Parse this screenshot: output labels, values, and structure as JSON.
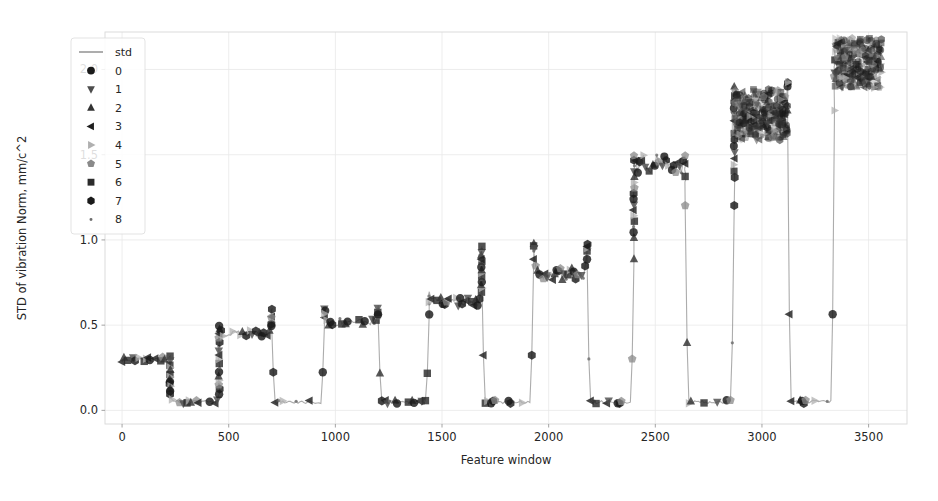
{
  "chart_data": {
    "type": "line",
    "title": "",
    "xlabel": "Feature window",
    "ylabel": "STD of vibration Norm, mm/c^2",
    "xlim": [
      -80,
      3680
    ],
    "ylim": [
      -0.08,
      2.22
    ],
    "xticks": [
      0,
      500,
      1000,
      1500,
      2000,
      2500,
      3000,
      3500
    ],
    "xticklabels": [
      "0",
      "500",
      "1000",
      "1500",
      "2000",
      "2500",
      "3000",
      "3500"
    ],
    "yticks": [
      0.0,
      0.5,
      1.0,
      1.5,
      2.0
    ],
    "yticklabels": [
      "0.0",
      "0.5",
      "1.0",
      "1.5",
      "2.0"
    ],
    "grid": true,
    "legend_position": "upper left",
    "legend_entries": [
      {
        "label": "std",
        "marker": "line",
        "color": "#808080"
      },
      {
        "label": "0",
        "marker": "circle",
        "color": "#1a1a1a"
      },
      {
        "label": "1",
        "marker": "triangle-down",
        "color": "#4d4d4d"
      },
      {
        "label": "2",
        "marker": "triangle-up",
        "color": "#333333"
      },
      {
        "label": "3",
        "marker": "triangle-left",
        "color": "#1f1f1f"
      },
      {
        "label": "4",
        "marker": "triangle-right",
        "color": "#b0b0b0"
      },
      {
        "label": "5",
        "marker": "pentagon",
        "color": "#8a8a8a"
      },
      {
        "label": "6",
        "marker": "square",
        "color": "#2b2b2b"
      },
      {
        "label": "7",
        "marker": "hexagon",
        "color": "#1a1a1a"
      },
      {
        "label": "8",
        "marker": "dot",
        "color": "#6e6e6e"
      }
    ],
    "baseline_value": 0.05,
    "segments": [
      {
        "x_start": 0,
        "x_end": 225,
        "level": 0.3,
        "spike": 0.32
      },
      {
        "x_start": 225,
        "x_end": 455,
        "level": 0.05,
        "spike": 0.1
      },
      {
        "x_start": 455,
        "x_end": 700,
        "level": 0.455,
        "spike": 0.5
      },
      {
        "x_start": 700,
        "x_end": 950,
        "level": 0.05,
        "spike": 0.6
      },
      {
        "x_start": 950,
        "x_end": 1200,
        "level": 0.515,
        "spike": 0.56
      },
      {
        "x_start": 1200,
        "x_end": 1440,
        "level": 0.05,
        "spike": 0.62
      },
      {
        "x_start": 1440,
        "x_end": 1685,
        "level": 0.635,
        "spike": 0.7
      },
      {
        "x_start": 1685,
        "x_end": 1930,
        "level": 0.05,
        "spike": 0.98
      },
      {
        "x_start": 1930,
        "x_end": 2180,
        "level": 0.8,
        "spike": 0.95
      },
      {
        "x_start": 2180,
        "x_end": 2400,
        "level": 0.05,
        "spike": 0.98
      },
      {
        "x_start": 2400,
        "x_end": 2640,
        "level": 1.45,
        "spike": 1.5
      },
      {
        "x_start": 2640,
        "x_end": 2870,
        "level": 0.05,
        "spike": 1.33
      },
      {
        "x_start": 2870,
        "x_end": 3120,
        "level": 1.72,
        "spike": 1.92
      },
      {
        "x_start": 3120,
        "x_end": 3340,
        "level": 0.05,
        "spike": 1.95
      },
      {
        "x_start": 3340,
        "x_end": 3560,
        "level": 2.02,
        "spike": 2.12
      }
    ],
    "series": [
      {
        "name": "std",
        "marker": "line",
        "color": "#909090"
      },
      {
        "name": "0",
        "marker": "circle",
        "color": "#1a1a1a"
      },
      {
        "name": "1",
        "marker": "triangle-down",
        "color": "#4d4d4d"
      },
      {
        "name": "2",
        "marker": "triangle-up",
        "color": "#333333"
      },
      {
        "name": "3",
        "marker": "triangle-left",
        "color": "#1f1f1f"
      },
      {
        "name": "4",
        "marker": "triangle-right",
        "color": "#b0b0b0"
      },
      {
        "name": "5",
        "marker": "pentagon",
        "color": "#8a8a8a"
      },
      {
        "name": "6",
        "marker": "square",
        "color": "#2b2b2b"
      },
      {
        "name": "7",
        "marker": "hexagon",
        "color": "#1a1a1a"
      },
      {
        "name": "8",
        "marker": "dot",
        "color": "#6e6e6e"
      }
    ]
  },
  "figure": {
    "background_color": "#ffffff",
    "grid_color": "#e8e8e8",
    "text_color": "#262626"
  }
}
